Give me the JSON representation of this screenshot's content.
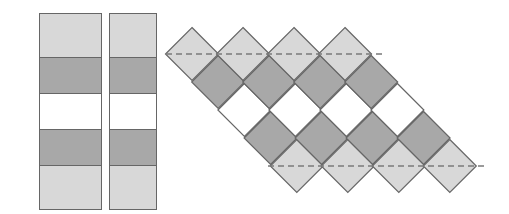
{
  "diagram": {
    "colors": {
      "light": "#d8d8d8",
      "dark": "#a8a8a8",
      "white": "#ffffff",
      "border": "#666666",
      "dash": "#7a7a7a"
    },
    "strip_pattern": [
      "light",
      "dark",
      "white",
      "dark",
      "light"
    ],
    "vertical_strips": [
      {
        "x": 39,
        "y": 13,
        "width": 63,
        "row_heights": [
          44,
          37,
          36,
          37,
          43
        ]
      },
      {
        "x": 109,
        "y": 13,
        "width": 48,
        "row_heights": [
          44,
          37,
          36,
          37,
          43
        ]
      }
    ],
    "on_point_set": {
      "strip_count": 4,
      "first_center": [
        192,
        54
      ],
      "strip_offset_x": 51,
      "step": [
        26.2,
        28
      ],
      "half_diagonal": 26.5
    },
    "trim_lines": [
      {
        "name": "top-trim-line",
        "x1": 166,
        "y1": 54,
        "x2": 382,
        "y2": 54
      },
      {
        "name": "bottom-trim-line",
        "x1": 268,
        "y1": 166,
        "x2": 486,
        "y2": 166
      }
    ]
  }
}
